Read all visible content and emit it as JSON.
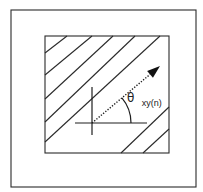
{
  "figure": {
    "type": "diagram",
    "colors": {
      "background": "#ffffff",
      "stroke": "#2a2a2a"
    },
    "outer_frame": {
      "x": 11,
      "y": 10,
      "width": 185,
      "height": 177
    },
    "inner_block": {
      "x": 45,
      "y": 36,
      "width": 124,
      "height": 117
    },
    "hatch_lines": [
      {
        "x1": 45,
        "y1": 53,
        "x2": 67,
        "y2": 36
      },
      {
        "x1": 45,
        "y1": 75,
        "x2": 92,
        "y2": 36
      },
      {
        "x1": 45,
        "y1": 99,
        "x2": 113,
        "y2": 36
      },
      {
        "x1": 45,
        "y1": 122,
        "x2": 135,
        "y2": 36
      },
      {
        "x1": 45,
        "y1": 142,
        "x2": 160,
        "y2": 36
      },
      {
        "x1": 121,
        "y1": 153,
        "x2": 169,
        "y2": 107
      },
      {
        "x1": 143,
        "y1": 153,
        "x2": 169,
        "y2": 129
      }
    ],
    "axes": {
      "origin": {
        "x": 92,
        "y": 123
      },
      "horizontal": {
        "x1": 75,
        "x2": 147
      },
      "vertical": {
        "y1": 87,
        "y2": 135
      }
    },
    "direction_vector": {
      "style": "dotted-arrow",
      "from": {
        "x": 92,
        "y": 123
      },
      "to": {
        "x": 160,
        "y": 66
      }
    },
    "angle_arc": {
      "radius": 39
    },
    "angle_label": {
      "symbol": "θ",
      "subscript": "xy(n)",
      "x": 127,
      "y": 102
    }
  }
}
